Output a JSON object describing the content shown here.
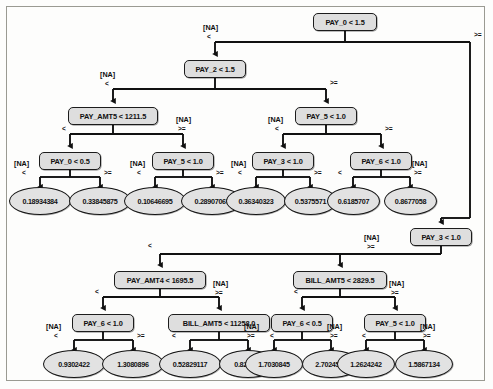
{
  "diagram": {
    "type": "decision-tree",
    "colors": {
      "node_fill": "#dedede",
      "leaf_fill": "#e2e2e2",
      "stroke": "#141414",
      "panel_border": "#9a9a92",
      "background": "#fdfdfc"
    },
    "edge_labels": {
      "less": "<",
      "greater_equal": ">=",
      "missing": "[NA]"
    },
    "trees": [
      {
        "name": "upper-tree",
        "root": "PAY_0 < 1.5",
        "internal_nodes": [
          {
            "id": "u0",
            "label": "PAY_0 < 1.5"
          },
          {
            "id": "u1",
            "label": "PAY_2 < 1.5"
          },
          {
            "id": "u2",
            "label": "PAY_AMT5 < 1211.5"
          },
          {
            "id": "u3",
            "label": "PAY_5 < 1.0"
          },
          {
            "id": "u4",
            "label": "PAY_0 < 0.5"
          },
          {
            "id": "u5",
            "label": "PAY_5 < 1.0"
          },
          {
            "id": "u6",
            "label": "PAY_3 < 1.0"
          },
          {
            "id": "u7",
            "label": "PAY_6 < 1.0"
          }
        ],
        "leaves": [
          {
            "id": "ul0",
            "value": "0.18934384"
          },
          {
            "id": "ul1",
            "value": "0.33845875"
          },
          {
            "id": "ul2",
            "value": "0.10646695"
          },
          {
            "id": "ul3",
            "value": "0.28907067"
          },
          {
            "id": "ul4",
            "value": "0.36340323"
          },
          {
            "id": "ul5",
            "value": "0.5375571"
          },
          {
            "id": "ul6",
            "value": "0.6185707"
          },
          {
            "id": "ul7",
            "value": "0.8677058"
          }
        ]
      },
      {
        "name": "lower-tree",
        "root": "PAY_3 < 1.0",
        "internal_nodes": [
          {
            "id": "l0",
            "label": "PAY_3 < 1.0"
          },
          {
            "id": "l1",
            "label": "PAY_AMT4 < 1695.5"
          },
          {
            "id": "l2",
            "label": "BILL_AMT5 < 2829.5"
          },
          {
            "id": "l3",
            "label": "PAY_6 < 1.0"
          },
          {
            "id": "l4",
            "label": "BILL_AMT5 < 11258.0"
          },
          {
            "id": "l5",
            "label": "PAY_6 < 0.5"
          },
          {
            "id": "l6",
            "label": "PAY_5 < 1.0"
          }
        ],
        "leaves": [
          {
            "id": "ll0",
            "value": "0.9302422"
          },
          {
            "id": "ll1",
            "value": "1.3080896"
          },
          {
            "id": "ll2",
            "value": "0.52829117"
          },
          {
            "id": "ll3",
            "value": "0.824859"
          },
          {
            "id": "ll4",
            "value": "1.7030845"
          },
          {
            "id": "ll5",
            "value": "2.7024593"
          },
          {
            "id": "ll6",
            "value": "1.2624242"
          },
          {
            "id": "ll7",
            "value": "1.5867134"
          }
        ]
      }
    ]
  }
}
